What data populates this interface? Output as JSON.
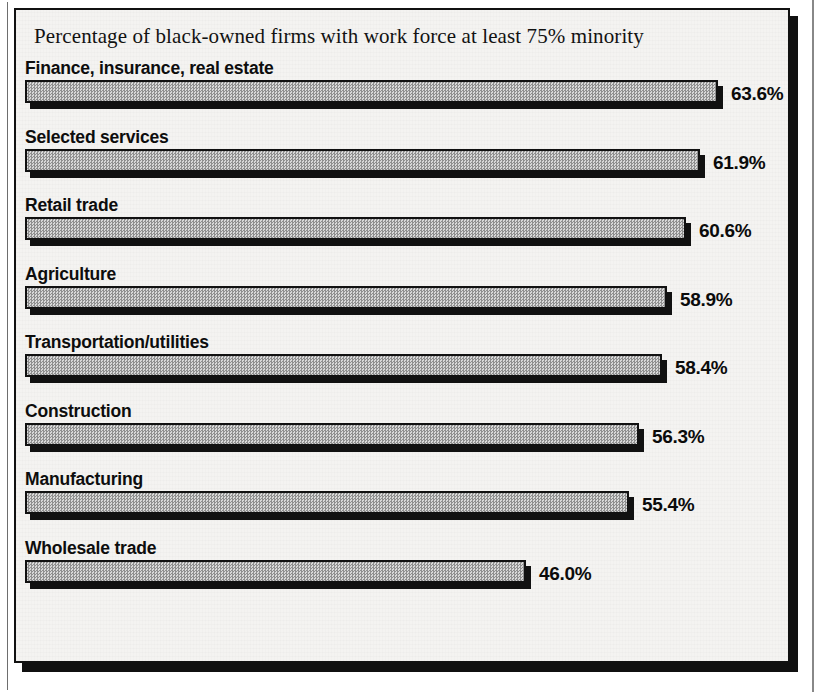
{
  "chart_data": {
    "type": "bar",
    "orientation": "horizontal",
    "title": "Percentage of black-owned firms with work force at least 75% minority",
    "xlabel": "",
    "ylabel": "",
    "xlim": [
      0,
      63.6
    ],
    "grid": false,
    "legend": "none",
    "value_suffix": "%",
    "categories": [
      "Finance, insurance, real estate",
      "Selected services",
      "Retail trade",
      "Agriculture",
      "Transportation/utilities",
      "Construction",
      "Manufacturing",
      "Wholesale trade"
    ],
    "values": [
      63.6,
      61.9,
      60.6,
      58.9,
      58.4,
      56.3,
      55.4,
      46.0
    ],
    "value_labels": [
      "63.6%",
      "61.9%",
      "60.6%",
      "58.9%",
      "58.4%",
      "56.3%",
      "55.4%",
      "46.0%"
    ],
    "colors": {
      "bar_fill": "#b9b9b9",
      "bar_outline": "#111111",
      "bar_shadow": "#111111",
      "text": "#0d0d0d",
      "background": "#f4f3f1",
      "frame": "#111111"
    }
  }
}
